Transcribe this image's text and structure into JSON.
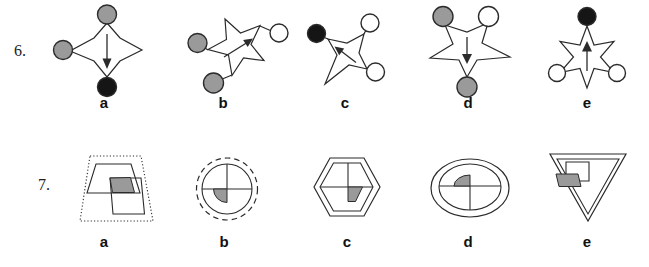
{
  "page": {
    "background": "#ffffff",
    "ink": "#2b2b2b"
  },
  "colors": {
    "gray": "#9a9a9a",
    "black": "#151515",
    "white": "#ffffff",
    "shade": "#9a9a9a"
  },
  "questions": [
    {
      "number": "6.",
      "options": [
        {
          "label": "a",
          "shape": "4-point star",
          "arrow": "down",
          "dots": [
            {
              "position": "top",
              "fill": "#9a9a9a"
            },
            {
              "position": "left",
              "fill": "#9a9a9a"
            },
            {
              "position": "bottom",
              "fill": "#151515"
            }
          ]
        },
        {
          "label": "b",
          "shape": "5-point star",
          "arrow": "up-right",
          "dots": [
            {
              "position": "left",
              "fill": "#9a9a9a"
            },
            {
              "position": "top-right",
              "fill": "#ffffff"
            },
            {
              "position": "bottom",
              "fill": "#9a9a9a"
            }
          ]
        },
        {
          "label": "c",
          "shape": "4-point star rotated",
          "arrow": "up-left",
          "dots": [
            {
              "position": "top-left",
              "fill": "#151515"
            },
            {
              "position": "top-right",
              "fill": "#ffffff"
            },
            {
              "position": "bottom-right",
              "fill": "#ffffff"
            }
          ]
        },
        {
          "label": "d",
          "shape": "5-point star inverted",
          "arrow": "down",
          "dots": [
            {
              "position": "top-left",
              "fill": "#9a9a9a"
            },
            {
              "position": "top-right",
              "fill": "#ffffff"
            },
            {
              "position": "bottom",
              "fill": "#9a9a9a"
            }
          ]
        },
        {
          "label": "e",
          "shape": "6-point star",
          "arrow": "up",
          "dots": [
            {
              "position": "top",
              "fill": "#151515"
            },
            {
              "position": "bottom-left",
              "fill": "#ffffff"
            },
            {
              "position": "bottom-right",
              "fill": "#ffffff"
            }
          ]
        }
      ]
    },
    {
      "number": "7.",
      "options": [
        {
          "label": "a",
          "outline": "dotted trapezoid",
          "content": "trapezoid and square overlapping with shaded quarter"
        },
        {
          "label": "b",
          "outline": "dashed circle",
          "content": "quartered circle with shaded quarter lower-left"
        },
        {
          "label": "c",
          "outline": "double hexagon",
          "content": "quartered hexagon with shaded quarter lower-right"
        },
        {
          "label": "d",
          "outline": "double ellipse",
          "content": "quartered ellipse with shaded quarter upper-left"
        },
        {
          "label": "e",
          "outline": "double inverted triangle",
          "content": "square with shaded quarter at lower-left corner"
        }
      ]
    }
  ]
}
